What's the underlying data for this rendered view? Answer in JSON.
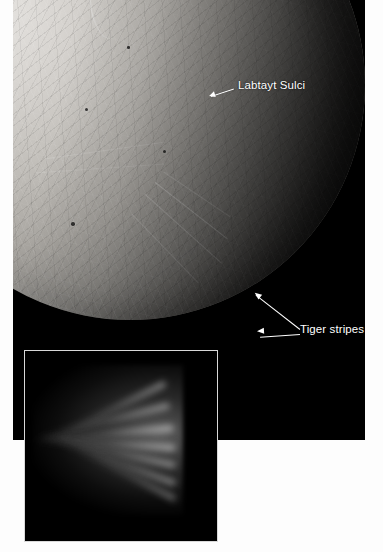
{
  "figure": {
    "main_image": {
      "subject": "enceladus-south-polar-terrain",
      "background_color": "#000000"
    },
    "annotations": [
      {
        "id": "labtayt-sulci",
        "label": "Labtayt Sulci",
        "x": 238,
        "y": 86,
        "arrows": 1
      },
      {
        "id": "tiger-stripes",
        "label": "Tiger stripes",
        "x": 300,
        "y": 330,
        "arrows": 2
      }
    ],
    "inset": {
      "subject": "plumes-erupting-from-south-pole",
      "background_color": "#000000",
      "border_color": "#d9d9d9"
    },
    "page_background": "#ffffff",
    "text_color": "#ffffff"
  }
}
